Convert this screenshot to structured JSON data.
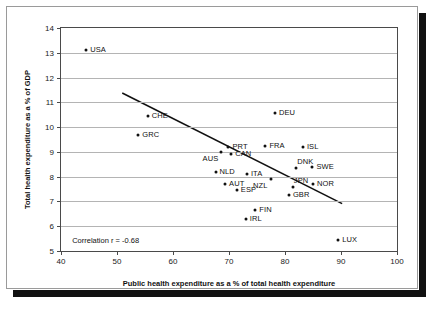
{
  "chart_data": {
    "type": "scatter",
    "title": "",
    "xlabel": "Public health expenditure as a % of total health expenditure",
    "ylabel": "Total health expenditure as a % of GDP",
    "xlim": [
      40,
      100
    ],
    "ylim": [
      5,
      14
    ],
    "xticks": [
      40,
      50,
      60,
      70,
      80,
      90,
      100
    ],
    "yticks": [
      5,
      6,
      7,
      8,
      9,
      10,
      11,
      12,
      13,
      14
    ],
    "grid": "horizontal",
    "legend": "none",
    "annotation": "Correlation r = -0.68",
    "trendline": {
      "x": [
        51.0,
        90.5
      ],
      "y": [
        11.35,
        6.85
      ]
    },
    "points": [
      {
        "label": "USA",
        "x": 44.5,
        "y": 13.1,
        "label_side": "right"
      },
      {
        "label": "CHE",
        "x": 55.5,
        "y": 10.45,
        "label_side": "right"
      },
      {
        "label": "GRC",
        "x": 53.8,
        "y": 9.7,
        "label_side": "right"
      },
      {
        "label": "DEU",
        "x": 78.2,
        "y": 10.55,
        "label_side": "right"
      },
      {
        "label": "PRT",
        "x": 69.9,
        "y": 9.2,
        "label_side": "right"
      },
      {
        "label": "FRA",
        "x": 76.5,
        "y": 9.25,
        "label_side": "right"
      },
      {
        "label": "ISL",
        "x": 83.2,
        "y": 9.2,
        "label_side": "right"
      },
      {
        "label": "AUS",
        "x": 68.5,
        "y": 9.0,
        "label_side": "below-left"
      },
      {
        "label": "CAN",
        "x": 70.4,
        "y": 8.9,
        "label_side": "right"
      },
      {
        "label": "DNK",
        "x": 82.0,
        "y": 8.35,
        "label_side": "above-right"
      },
      {
        "label": "SWE",
        "x": 84.9,
        "y": 8.4,
        "label_side": "right"
      },
      {
        "label": "NLD",
        "x": 67.6,
        "y": 8.2,
        "label_side": "right"
      },
      {
        "label": "ITA",
        "x": 73.2,
        "y": 8.1,
        "label_side": "right"
      },
      {
        "label": "AUT",
        "x": 69.3,
        "y": 7.7,
        "label_side": "right"
      },
      {
        "label": "NZL",
        "x": 77.5,
        "y": 7.9,
        "label_side": "below-left"
      },
      {
        "label": "JPN",
        "x": 81.4,
        "y": 7.6,
        "label_side": "above-right"
      },
      {
        "label": "NOR",
        "x": 85.0,
        "y": 7.7,
        "label_side": "right"
      },
      {
        "label": "ESP",
        "x": 71.4,
        "y": 7.45,
        "label_side": "right"
      },
      {
        "label": "GBR",
        "x": 80.7,
        "y": 7.25,
        "label_side": "right"
      },
      {
        "label": "FIN",
        "x": 74.7,
        "y": 6.65,
        "label_side": "right"
      },
      {
        "label": "IRL",
        "x": 73.0,
        "y": 6.3,
        "label_side": "right"
      },
      {
        "label": "LUX",
        "x": 89.5,
        "y": 5.45,
        "label_side": "right"
      }
    ]
  },
  "colors": {
    "point": "#111111",
    "gridline": "#b4b4b4",
    "axis": "#4a4a4a",
    "frame": "#9a9a9a",
    "text": "#111111"
  }
}
